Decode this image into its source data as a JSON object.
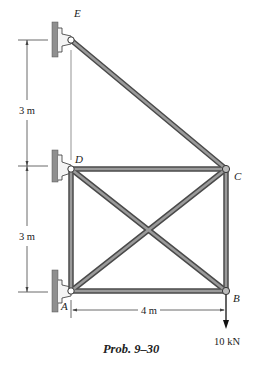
{
  "caption": "Prob. 9–30",
  "joints": {
    "A": {
      "label": "A"
    },
    "B": {
      "label": "B"
    },
    "C": {
      "label": "C"
    },
    "D": {
      "label": "D"
    },
    "E": {
      "label": "E"
    }
  },
  "dimensions": {
    "upper_vertical": "3 m",
    "lower_vertical": "3 m",
    "horizontal": "4 m"
  },
  "load": {
    "label": "10 kN",
    "joint": "B",
    "direction": "down"
  },
  "members": [
    "AB",
    "AD",
    "DC",
    "CB",
    "AC",
    "DB",
    "EC"
  ],
  "supports": [
    "A",
    "D",
    "E"
  ],
  "colors": {
    "member_fill": "#8a8a8a",
    "member_edge": "#4a4a4a",
    "wall": "#8f8f8f",
    "line": "#333333"
  }
}
